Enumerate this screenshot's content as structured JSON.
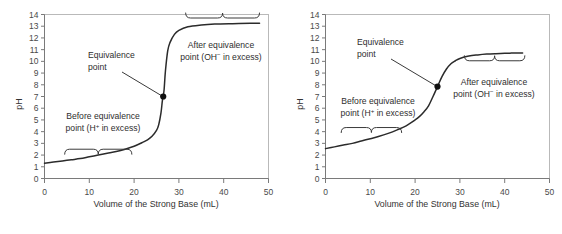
{
  "figure": {
    "name": "strong-acid-and-weak-acid-titration-curves",
    "panel_count": 2
  },
  "chart_data": [
    {
      "type": "line",
      "panel": "left",
      "title": "",
      "xlabel": "Volume of the Strong Base (mL)",
      "ylabel": "pH",
      "xlim": [
        0,
        50
      ],
      "ylim": [
        0,
        14
      ],
      "xticks": [
        0,
        10,
        20,
        30,
        40,
        50
      ],
      "yticks": [
        0,
        1,
        2,
        3,
        4,
        5,
        6,
        7,
        8,
        9,
        10,
        11,
        12,
        13,
        14
      ],
      "grid": false,
      "legend": false,
      "series": [
        {
          "name": "Strong acid titrated with strong base",
          "x": [
            0,
            2,
            4,
            6,
            8,
            10,
            12,
            14,
            16,
            18,
            20,
            22,
            23,
            24,
            25,
            25.5,
            26,
            26.3,
            26.5,
            26.7,
            27,
            27.5,
            28,
            29,
            30,
            32,
            35,
            38,
            42,
            46,
            48
          ],
          "y": [
            1.3,
            1.4,
            1.5,
            1.6,
            1.7,
            1.85,
            2.0,
            2.15,
            2.3,
            2.5,
            2.75,
            3.1,
            3.3,
            3.6,
            4.1,
            4.6,
            5.6,
            6.6,
            7.05,
            7.6,
            9.2,
            10.9,
            11.6,
            12.3,
            12.65,
            12.95,
            13.1,
            13.18,
            13.22,
            13.25,
            13.26
          ]
        }
      ],
      "annotations": [
        {
          "name": "equivalence-point-label",
          "lines": [
            "Equivalence",
            "point"
          ],
          "target_x": 26.5,
          "target_y": 7.0
        },
        {
          "name": "before-equivalence-label",
          "lines": [
            "Before equivalence",
            "point (H+ in excess)"
          ],
          "line1": "Before equivalence",
          "line2_prefix": "point (H",
          "line2_sup": "+",
          "line2_suffix": " in excess)",
          "brace_from_x": 4.5,
          "brace_to_x": 19.5,
          "brace_pH": 2.5
        },
        {
          "name": "after-equivalence-label",
          "lines": [
            "After equivalence",
            "point (OH- in excess)"
          ],
          "line1": "After equivalence",
          "line2_prefix": "point (OH",
          "line2_sup": "−",
          "line2_suffix": " in excess)",
          "brace_from_x": 31.5,
          "brace_to_x": 48.0,
          "brace_pH": 13.7
        }
      ],
      "markers": [
        {
          "name": "equivalence-point-marker",
          "x": 26.5,
          "y": 7.0
        }
      ]
    },
    {
      "type": "line",
      "panel": "right",
      "title": "",
      "xlabel": "Volume of the Strong Base (mL)",
      "ylabel": "pH",
      "xlim": [
        0,
        50
      ],
      "ylim": [
        0,
        14
      ],
      "xticks": [
        0,
        10,
        20,
        30,
        40,
        50
      ],
      "yticks": [
        0,
        1,
        2,
        3,
        4,
        5,
        6,
        7,
        8,
        9,
        10,
        11,
        12,
        13,
        14
      ],
      "grid": false,
      "legend": false,
      "series": [
        {
          "name": "Weak acid titrated with strong base",
          "x": [
            0,
            2,
            4,
            6,
            8,
            10,
            12,
            14,
            16,
            18,
            20,
            21,
            22,
            23,
            24,
            25,
            26,
            27,
            28,
            29,
            30,
            32,
            34,
            36,
            38,
            40,
            42,
            44
          ],
          "y": [
            2.55,
            2.7,
            2.85,
            3.0,
            3.2,
            3.4,
            3.6,
            3.85,
            4.15,
            4.5,
            5.0,
            5.3,
            5.7,
            6.2,
            7.0,
            7.85,
            8.7,
            9.35,
            9.8,
            10.05,
            10.25,
            10.45,
            10.55,
            10.62,
            10.66,
            10.69,
            10.71,
            10.72
          ]
        }
      ],
      "annotations": [
        {
          "name": "equivalence-point-label",
          "lines": [
            "Equivalence",
            "point"
          ],
          "target_x": 25.0,
          "target_y": 7.85
        },
        {
          "name": "before-equivalence-label",
          "lines": [
            "Before equivalence",
            "point (H+ in excess)"
          ],
          "line1": "Before equivalence",
          "line2_prefix": "point (H",
          "line2_sup": "+",
          "line2_suffix": " in excess)",
          "brace_from_x": 3.5,
          "brace_to_x": 17.0,
          "brace_pH": 4.35
        },
        {
          "name": "after-equivalence-label",
          "lines": [
            "After equivalence",
            "point (OH- in excess)"
          ],
          "line1": "After equivalence",
          "line2_prefix": "point (OH",
          "line2_sup": "−",
          "line2_suffix": " in excess)",
          "brace_from_x": 31.0,
          "brace_to_x": 44.5,
          "brace_pH": 10.05
        }
      ],
      "markers": [
        {
          "name": "equivalence-point-marker",
          "x": 25.0,
          "y": 7.85
        }
      ]
    }
  ],
  "style": {
    "curve_color": "#2b2b2b",
    "frame_color": "#b9b9b9",
    "axis_color": "#7a7a7a",
    "text_color": "#2e2e2e",
    "marker_color": "#111111",
    "background": "#ffffff"
  }
}
